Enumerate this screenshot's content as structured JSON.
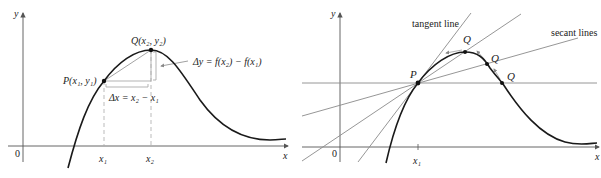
{
  "left_panel": {
    "axis_y_label": "y",
    "axis_x_label": "x",
    "origin_label": "0",
    "point_p_label": "P",
    "point_p_coords": "(x₁, y₁)",
    "point_q_label": "Q",
    "point_q_coords": "(x₂, y₂)",
    "delta_y_label": "Δy = f(x₂) − f(x₁)",
    "delta_x_label": "Δx = x₂ − x₁",
    "tick_x1": "x₁",
    "tick_x2": "x₂"
  },
  "right_panel": {
    "axis_y_label": "y",
    "axis_x_label": "x",
    "origin_label": "0",
    "point_p_label": "P",
    "q_labels": [
      "Q",
      "Q",
      "Q"
    ],
    "tangent_label": "tangent line",
    "secant_label": "secant lines",
    "tick_x1": "x₁"
  },
  "colors": {
    "curve": "#1a1a1a",
    "axis": "#555555",
    "lines": "#8a8a8a",
    "guides": "#b0b0b0"
  }
}
